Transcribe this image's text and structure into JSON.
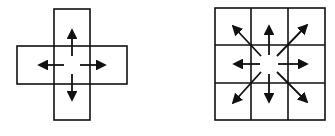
{
  "diagram": {
    "colors": {
      "stroke": "#111111",
      "background": "#ffffff"
    },
    "left": {
      "name": "4-neighborhood",
      "arrows": [
        "up",
        "down",
        "left",
        "right"
      ]
    },
    "right": {
      "name": "8-neighborhood",
      "grid": "3x3",
      "arrows": [
        "up",
        "down",
        "left",
        "right",
        "up-left",
        "up-right",
        "down-left",
        "down-right"
      ]
    }
  }
}
